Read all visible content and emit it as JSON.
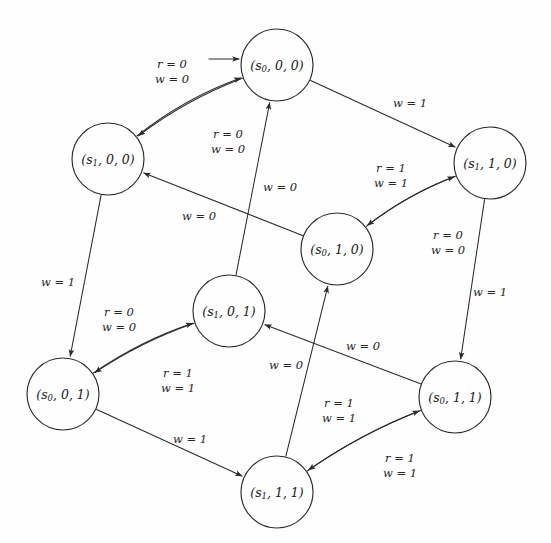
{
  "diagram": {
    "type": "state-transition-diagram",
    "title": "",
    "width": 551,
    "height": 543,
    "initial_state_id": "s0_0_0",
    "initial_marker": "incoming-arrow",
    "stroke_color": "#2b2b2b",
    "background_color": "#fefefe",
    "node_radius": 36,
    "nodes": [
      {
        "id": "s0_0_0",
        "label_prefix": "(",
        "state": "s",
        "state_sub": "0",
        "rest": ", 0, 0)",
        "full_label": "(s0, 0, 0)",
        "cx": 277,
        "cy": 65,
        "r": 36
      },
      {
        "id": "s1_0_0",
        "label_prefix": "(",
        "state": "s",
        "state_sub": "1",
        "rest": ", 0, 0)",
        "full_label": "(s1, 0, 0)",
        "cx": 108,
        "cy": 159,
        "r": 36
      },
      {
        "id": "s1_1_0",
        "label_prefix": "(",
        "state": "s",
        "state_sub": "1",
        "rest": ", 1, 0)",
        "full_label": "(s1, 1, 0)",
        "cx": 490,
        "cy": 163,
        "r": 36
      },
      {
        "id": "s0_1_0",
        "label_prefix": "(",
        "state": "s",
        "state_sub": "0",
        "rest": ", 1, 0)",
        "full_label": "(s0, 1, 0)",
        "cx": 337,
        "cy": 249,
        "r": 36
      },
      {
        "id": "s1_0_1",
        "label_prefix": "(",
        "state": "s",
        "state_sub": "1",
        "rest": ", 0, 1)",
        "full_label": "(s1, 0, 1)",
        "cx": 229,
        "cy": 311,
        "r": 36
      },
      {
        "id": "s0_0_1",
        "label_prefix": "(",
        "state": "s",
        "state_sub": "0",
        "rest": ", 0, 1)",
        "full_label": "(s0, 0, 1)",
        "cx": 63,
        "cy": 394,
        "r": 36
      },
      {
        "id": "s0_1_1",
        "label_prefix": "(",
        "state": "s",
        "state_sub": "0",
        "rest": ", 1, 1)",
        "full_label": "(s0, 1, 1)",
        "cx": 455,
        "cy": 397,
        "r": 36
      },
      {
        "id": "s1_1_1",
        "label_prefix": "(",
        "state": "s",
        "state_sub": "1",
        "rest": ", 1, 1)",
        "full_label": "(s1, 1, 1)",
        "cx": 277,
        "cy": 492,
        "r": 36
      }
    ],
    "edges": [
      {
        "id": "e1",
        "from": "s1_0_0",
        "to": "s0_0_0",
        "label_lines": [
          "r = 0",
          "w = 0"
        ],
        "label_x": 172,
        "label_y": 72
      },
      {
        "id": "e2",
        "from": "s0_0_0",
        "to": "s1_0_0",
        "label_lines": [
          "r = 0",
          "w = 0"
        ],
        "label_x": 228,
        "label_y": 142
      },
      {
        "id": "e3",
        "from": "s0_0_0",
        "to": "s1_1_0",
        "label_lines": [
          "w = 1"
        ],
        "label_x": 410,
        "label_y": 104
      },
      {
        "id": "e4",
        "from": "s0_1_0",
        "to": "s1_1_0",
        "label_lines": [
          "r = 1",
          "w = 1"
        ],
        "label_x": 391,
        "label_y": 176
      },
      {
        "id": "e5",
        "from": "s1_1_0",
        "to": "s0_1_0",
        "label_lines": [
          "r = 0",
          "w = 0"
        ],
        "label_x": 448,
        "label_y": 243
      },
      {
        "id": "e6",
        "from": "s0_1_0",
        "to": "s1_0_0",
        "label_lines": [
          "w = 0"
        ],
        "label_x": 199,
        "label_y": 217
      },
      {
        "id": "e7",
        "from": "s1_0_1",
        "to": "s0_0_0",
        "label_lines": [
          "w = 0"
        ],
        "label_x": 280,
        "label_y": 188
      },
      {
        "id": "e8",
        "from": "s1_0_0",
        "to": "s0_0_1",
        "label_lines": [
          "w = 1"
        ],
        "label_x": 58,
        "label_y": 283
      },
      {
        "id": "e9",
        "from": "s0_0_1",
        "to": "s1_0_1",
        "label_lines": [
          "r = 0",
          "w = 0"
        ],
        "label_x": 119,
        "label_y": 320
      },
      {
        "id": "e10",
        "from": "s1_0_1",
        "to": "s0_0_1",
        "label_lines": [
          "r = 1",
          "w = 1"
        ],
        "label_x": 178,
        "label_y": 381
      },
      {
        "id": "e11",
        "from": "s1_1_0",
        "to": "s0_1_1",
        "label_lines": [
          "w = 1"
        ],
        "label_x": 490,
        "label_y": 293
      },
      {
        "id": "e12",
        "from": "s0_1_1",
        "to": "s1_0_1",
        "label_lines": [
          "w = 0"
        ],
        "label_x": 363,
        "label_y": 347
      },
      {
        "id": "e13",
        "from": "s1_1_1",
        "to": "s0_1_0",
        "label_lines": [
          "w = 0"
        ],
        "label_x": 286,
        "label_y": 366
      },
      {
        "id": "e14",
        "from": "s1_1_1",
        "to": "s0_1_1",
        "label_lines": [
          "r = 1",
          "w = 1"
        ],
        "label_x": 339,
        "label_y": 411
      },
      {
        "id": "e15",
        "from": "s0_1_1",
        "to": "s1_1_1",
        "label_lines": [
          "r = 1",
          "w = 1"
        ],
        "label_x": 400,
        "label_y": 466
      },
      {
        "id": "e16",
        "from": "s0_0_1",
        "to": "s1_1_1",
        "label_lines": [
          "w = 1"
        ],
        "label_x": 190,
        "label_y": 440
      }
    ]
  }
}
